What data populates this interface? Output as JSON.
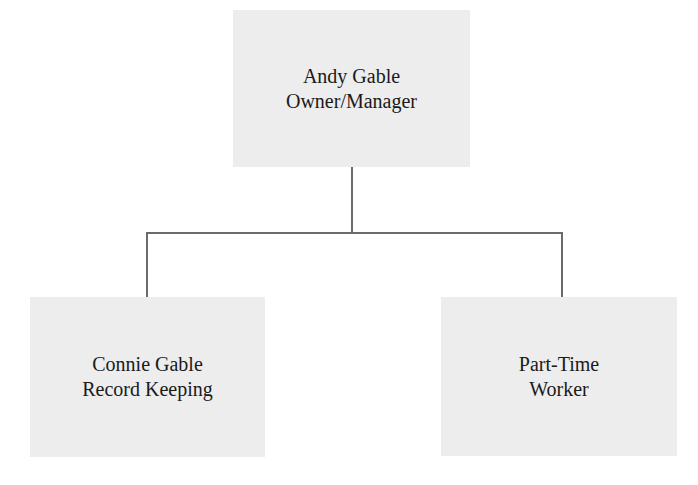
{
  "org_chart": {
    "nodes": [
      {
        "id": "owner",
        "name": "Andy Gable",
        "role": "Owner/Manager",
        "level": 0
      },
      {
        "id": "record-keeping",
        "name": "Connie Gable",
        "role": "Record Keeping",
        "level": 1,
        "parent": "owner"
      },
      {
        "id": "part-time",
        "name": "Part-Time",
        "role": "Worker",
        "level": 1,
        "parent": "owner"
      }
    ],
    "colors": {
      "box_fill": "#ededed",
      "connector": "#6b6b6b",
      "text": "#1a1a1a",
      "background": "#ffffff"
    }
  }
}
